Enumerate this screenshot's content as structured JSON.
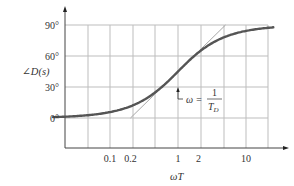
{
  "chart_data": {
    "type": "line",
    "title": "",
    "xlabel": "ωT",
    "ylabel": "∠D(s)",
    "xscale": "log",
    "xlim": [
      0.025,
      40
    ],
    "ylim": [
      0,
      90
    ],
    "grid": true,
    "x_ticks": [
      {
        "value": 0.1,
        "label": "0.1"
      },
      {
        "value": 0.2,
        "label": "0.2"
      },
      {
        "value": 1,
        "label": "1"
      },
      {
        "value": 2,
        "label": "2"
      },
      {
        "value": 10,
        "label": "10"
      }
    ],
    "y_ticks": [
      {
        "value": 0,
        "label": "0°"
      },
      {
        "value": 30,
        "label": "30°"
      },
      {
        "value": 60,
        "label": "60°"
      },
      {
        "value": 90,
        "label": "90°"
      }
    ],
    "series": [
      {
        "name": "exact phase",
        "style": "thick",
        "x": [
          0.025,
          0.05,
          0.1,
          0.2,
          0.3,
          0.5,
          0.7,
          1,
          1.5,
          2,
          3,
          5,
          10,
          20,
          40
        ],
        "values": [
          1.4,
          2.9,
          5.7,
          11.3,
          16.7,
          26.6,
          35.0,
          45.0,
          56.3,
          63.4,
          71.6,
          78.7,
          84.3,
          87.1,
          88.6
        ]
      },
      {
        "name": "asymptote",
        "style": "thin",
        "x": [
          0.2,
          5
        ],
        "values": [
          0,
          90
        ]
      }
    ],
    "annotations": [
      {
        "text": "ω = 1/T_D",
        "x": 1,
        "y_deg": 30,
        "type": "arrow-up"
      }
    ]
  },
  "labels": {
    "ylabel": "∠D(s)",
    "xlabel": "ωT",
    "annot_omega": "ω =",
    "annot_num": "1",
    "annot_den": "T",
    "annot_den_sub": "D"
  }
}
